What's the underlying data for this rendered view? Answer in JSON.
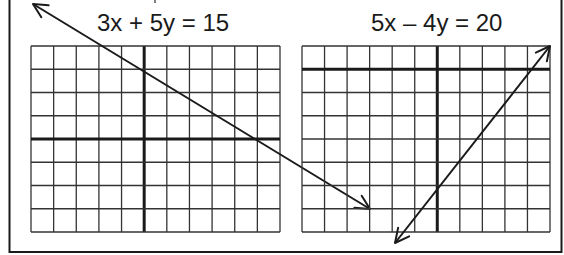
{
  "colors": {
    "ink": "#1a1a1a",
    "grid": "#333333",
    "background": "#ffffff"
  },
  "frame": {
    "left": 9.5,
    "right": 561.5,
    "bottom": 252
  },
  "graphs": [
    {
      "id": "left",
      "equation": "3x + 5y = 15",
      "label_pos": {
        "x": 97,
        "y": 11
      },
      "grid": {
        "x0": 31,
        "y0": 46,
        "x1": 280,
        "y1": 232,
        "cols": 11,
        "rows": 8,
        "yaxis_col": 5,
        "xaxis_row": 4
      },
      "line": {
        "from": [
          33,
          4
        ],
        "to": [
          370,
          209
        ],
        "arrow_start": true,
        "arrow_end": true
      },
      "intercepts": {
        "x": 5,
        "y": 3
      }
    },
    {
      "id": "right",
      "equation": "5x – 4y = 20",
      "label_pos": {
        "x": 371,
        "y": 11
      },
      "grid": {
        "x0": 302,
        "y0": 46,
        "x1": 550,
        "y1": 232,
        "cols": 11,
        "rows": 8,
        "yaxis_col": 6,
        "xaxis_row": 1
      },
      "line": {
        "from": [
          395,
          243
        ],
        "to": [
          550,
          46
        ],
        "arrow_start": true,
        "arrow_end": true
      },
      "intercepts": {
        "x": 4,
        "y": -5
      }
    }
  ]
}
